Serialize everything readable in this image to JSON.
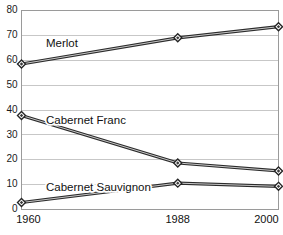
{
  "chart_data": {
    "type": "line",
    "title": "",
    "subtitle": "",
    "xlabel": "",
    "ylabel": "",
    "categories": [
      "1960",
      "1988",
      "2000"
    ],
    "x": [
      1960,
      1988,
      2000
    ],
    "ylim": [
      0,
      80
    ],
    "yticks": [
      0,
      10,
      20,
      30,
      40,
      50,
      60,
      70,
      80
    ],
    "ytick_labels": [
      "0",
      "10",
      "20",
      "30",
      "40",
      "50",
      "60",
      "70",
      "80"
    ],
    "xtick_labels": [
      "1960",
      "1988",
      "2000"
    ],
    "grid": "horizontal",
    "legend_position": "inline-annotations",
    "marker": "diamond",
    "series": [
      {
        "name": "Merlot",
        "values": [
          58.5,
          69.0,
          73.5
        ],
        "color": "#2b2b2b",
        "label_annotation": "Merlot"
      },
      {
        "name": "Cabernet Franc",
        "values": [
          37.8,
          18.7,
          15.5
        ],
        "color": "#2b2b2b",
        "label_annotation": "Cabernet Franc"
      },
      {
        "name": "Cabernet Sauvignon",
        "values": [
          2.8,
          10.6,
          9.3
        ],
        "color": "#2b2b2b",
        "label_annotation": "Cabernet Sauvignon"
      }
    ],
    "annotations": [
      {
        "text": "Merlot",
        "x_px": 46,
        "y_px": 44
      },
      {
        "text": "Cabernet Franc",
        "x_px": 46,
        "y_px": 121
      },
      {
        "text": "Cabernet Sauvignon",
        "x_px": 46,
        "y_px": 188
      }
    ],
    "colors": {
      "background": "#ffffff",
      "gridline": "#b9b9b9",
      "axis_frame": "#9a9a9a",
      "line": "#2b2b2b",
      "line_highlight": "#c8c8c8",
      "text": "#111111",
      "marker_fill": "#ffffff",
      "marker_edge": "#242424"
    }
  }
}
